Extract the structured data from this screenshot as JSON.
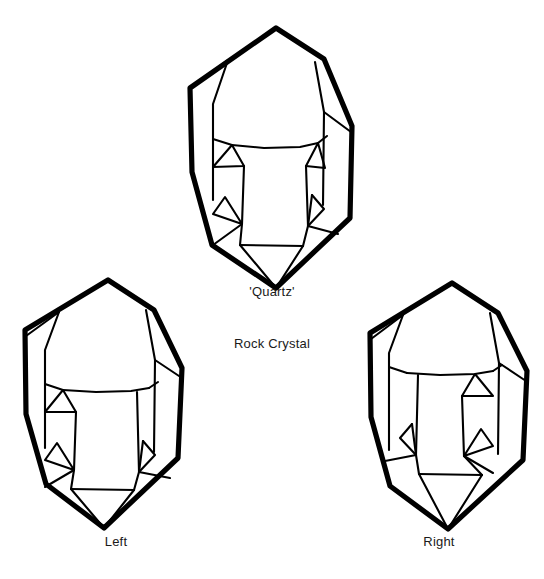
{
  "figure": {
    "background_color": "#ffffff",
    "line_color": "#000000",
    "outline_width_px": 5,
    "facet_width_px": 2,
    "specimen_count": 3
  },
  "captions": {
    "top": "'Quartz'",
    "center": "Rock Crystal",
    "bottom_left": "Left",
    "bottom_right": "Right"
  },
  "specimens": [
    {
      "id": "top",
      "label": "'Quartz'",
      "position": "top-center",
      "bounds": {
        "x": 186,
        "y": 25,
        "width": 167,
        "height": 266
      },
      "description": "Doubly terminated hexagonal prism, upright orientation"
    },
    {
      "id": "left",
      "label": "Left",
      "position": "bottom-left",
      "bounds": {
        "x": 22,
        "y": 277,
        "width": 163,
        "height": 253
      },
      "description": "Left-handed quartz crystal with trigonal trapezohedral face on lower left"
    },
    {
      "id": "right",
      "label": "Right",
      "position": "bottom-right",
      "bounds": {
        "x": 370,
        "y": 280,
        "width": 160,
        "height": 250
      },
      "description": "Right-handed quartz crystal with trigonal trapezohedral face on lower right"
    }
  ]
}
